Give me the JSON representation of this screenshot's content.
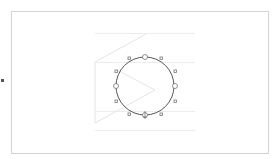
{
  "canvas": {
    "frame_color": "#d4d4d4",
    "guide_color": "#ebebeb",
    "sketch_color": "#e6e6e6",
    "selection_color": "#555555"
  },
  "selected_shape": {
    "type": "circle",
    "cx": 145,
    "cy": 86,
    "r": 29,
    "handles": {
      "large": [
        "top",
        "left",
        "right",
        "bottom"
      ],
      "small": [
        "top-left",
        "top-right",
        "upper-left",
        "upper-right",
        "lower-left",
        "lower-right",
        "bottom-left",
        "bottom-right"
      ]
    }
  }
}
